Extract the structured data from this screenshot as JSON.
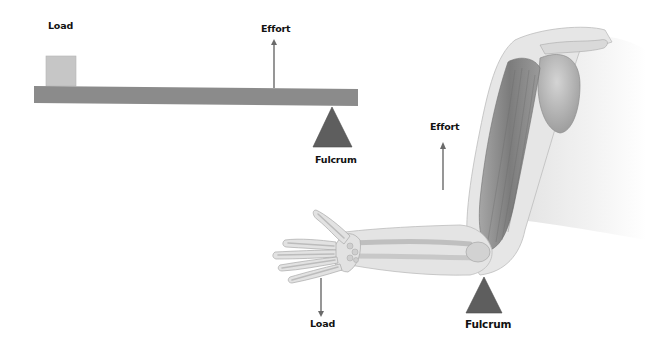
{
  "lever_diagram": {
    "load_label": "Load",
    "effort_label": "Effort",
    "fulcrum_label": "Fulcrum"
  },
  "arm_diagram": {
    "effort_label": "Effort",
    "load_label": "Load",
    "fulcrum_label": "Fulcrum"
  },
  "colors": {
    "beam": "#8a8a8a",
    "load_box": "#c4c4c4",
    "fulcrum": "#5e5e5e",
    "arrow": "#6a6a6a",
    "text": "#111111",
    "skin": "#e3e3e3",
    "bone": "#cfcfcf",
    "muscle": "#8f8f8f"
  }
}
